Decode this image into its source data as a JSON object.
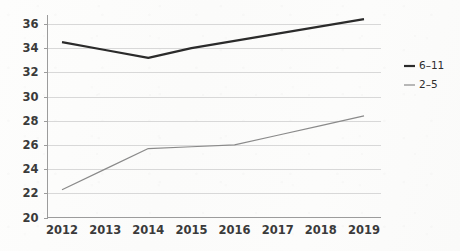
{
  "chart_data": {
    "type": "line",
    "title": "",
    "subtitle": "",
    "xlabel": "",
    "ylabel": "",
    "categories": [
      "2012",
      "2013",
      "2014",
      "2015",
      "2016",
      "2017",
      "2018",
      "2019"
    ],
    "x": [
      2012,
      2013,
      2014,
      2015,
      2016,
      2017,
      2018,
      2019
    ],
    "series": [
      {
        "name": "6–11",
        "color": "#2b2b2b",
        "width": 2.2,
        "values": [
          34.5,
          33.85,
          33.2,
          34.0,
          34.6,
          35.2,
          35.8,
          36.4
        ]
      },
      {
        "name": "2–5",
        "color": "#8a8a8a",
        "width": 1.2,
        "values": [
          22.3,
          24.0,
          25.7,
          25.85,
          26.0,
          26.8,
          27.6,
          28.4
        ]
      }
    ],
    "ylim": [
      20,
      36
    ],
    "yticks": [
      20,
      22,
      24,
      26,
      28,
      30,
      32,
      34,
      36
    ],
    "ytick_labels": [
      "20",
      "22",
      "24",
      "26",
      "28",
      "30",
      "32",
      "34",
      "36"
    ],
    "grid": true,
    "grid_axis": "y",
    "legend": {
      "position": "right",
      "entries": [
        {
          "label": "6–11",
          "color": "#2b2b2b",
          "width": 2.2
        },
        {
          "label": "2–5",
          "color": "#8a8a8a",
          "width": 1.2
        }
      ]
    },
    "colors": {
      "background": "#fbfbfa",
      "grid": "#d8d8d8",
      "axis": "#9c9c9c",
      "text": "#3a3a3a",
      "series_6_11": "#2b2b2b",
      "series_2_5": "#8a8a8a"
    }
  }
}
